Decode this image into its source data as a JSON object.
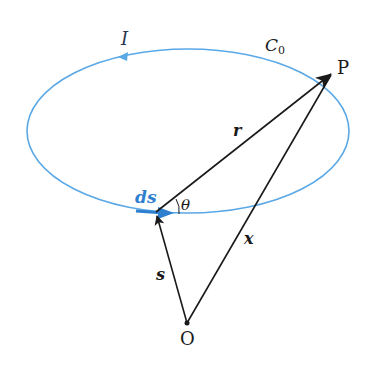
{
  "diagram": {
    "type": "biot-savart-geometry",
    "colors": {
      "loop": "#5aa8e6",
      "ds_element": "#2f7fcf",
      "vectors": "#1a1a1a",
      "background": "#ffffff"
    },
    "loop": {
      "label": "C",
      "label_subscript": "0",
      "current_label": "I",
      "shape": "ellipse",
      "center": [
        188,
        131
      ],
      "rx": 161,
      "ry": 82
    },
    "points": {
      "origin": {
        "label": "O",
        "pos": [
          187,
          323
        ]
      },
      "field_point": {
        "label": "P",
        "pos": [
          330,
          73
        ]
      },
      "source_point": {
        "pos": [
          156,
          212
        ]
      }
    },
    "vectors": [
      {
        "label": "r",
        "from": "source_point",
        "to": "field_point"
      },
      {
        "label": "x",
        "from": "origin",
        "to": "field_point"
      },
      {
        "label": "s",
        "from": "origin",
        "to": "source_point"
      },
      {
        "label": "ds",
        "at": "source_point",
        "direction": "tangent"
      }
    ],
    "angle": {
      "label": "θ",
      "between": [
        "ds",
        "r"
      ]
    }
  }
}
